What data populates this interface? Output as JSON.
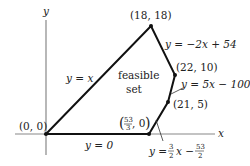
{
  "diagram": {
    "type": "feasible-region",
    "axes": {
      "x_label": "x",
      "y_label": "y"
    },
    "region_label_line1": "feasible",
    "region_label_line2": "set",
    "vertices": [
      {
        "label": "(0, 0)",
        "x": 0,
        "y": 0
      },
      {
        "label": "(18, 18)",
        "x": 18,
        "y": 18
      },
      {
        "label": "(22, 10)",
        "x": 22,
        "y": 10
      },
      {
        "label": "(21, 5)",
        "x": 21,
        "y": 5
      },
      {
        "label": "(53/3, 0)",
        "x": 17.667,
        "y": 0
      }
    ],
    "edges": [
      {
        "label": "y = x"
      },
      {
        "label": "y = −2x + 54"
      },
      {
        "label": "y = 5x − 100"
      },
      {
        "label": "y = (3/2)x − 53/2"
      },
      {
        "label": "y = 0"
      }
    ],
    "colors": {
      "axis": "#888888",
      "edge": "#111111",
      "text": "#222222"
    }
  },
  "text": {
    "v0": "(0, 0)",
    "v1": "(18, 18)",
    "v2": "(22, 10)",
    "v3": "(21, 5)",
    "v4_num": "53",
    "v4_den": "3",
    "v4_rest": ", 0",
    "e_yx": "y = x",
    "e_m2": "y = −2x + 54",
    "e_5x": "y = 5x − 100",
    "e_32_pre": "y = ",
    "e_32_n1": "3",
    "e_32_d1": "2",
    "e_32_mid": "x −",
    "e_32_n2": "53",
    "e_32_d2": "2",
    "e_y0": "y = 0",
    "ax_x": "x",
    "ax_y": "y",
    "feasible": "feasible",
    "set": "set"
  }
}
